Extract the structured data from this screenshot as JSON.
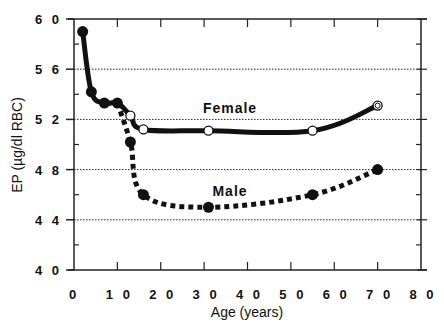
{
  "chart_data": {
    "type": "line",
    "title": "",
    "xlabel": "Age (years)",
    "ylabel": "EP (µg/dl RBC)",
    "xlim": [
      0,
      80
    ],
    "ylim": [
      40,
      60
    ],
    "x_ticks": [
      0,
      10,
      20,
      30,
      40,
      50,
      60,
      70,
      80
    ],
    "x_tick_labels": [
      "0",
      "1 0",
      "2 0",
      "3 0",
      "4 0",
      "5 0",
      "6 0",
      "7 0",
      "8 0"
    ],
    "y_ticks": [
      40,
      44,
      48,
      52,
      56,
      60
    ],
    "y_tick_labels": [
      "4 0",
      "4 4",
      "4 8",
      "5 2",
      "5 6",
      "6 0"
    ],
    "grid": "horizontal dotted at 44, 48, 52, 56",
    "series": [
      {
        "name": "Female",
        "style": "solid line, open circles",
        "x": [
          2,
          4,
          7,
          10,
          13,
          16,
          31,
          55,
          70
        ],
        "y": [
          59,
          54.2,
          53.3,
          53.3,
          52.3,
          51.2,
          51.1,
          51.1,
          53.1
        ]
      },
      {
        "name": "Male",
        "style": "dotted line, filled circles",
        "x": [
          2,
          4,
          7,
          10,
          13,
          16,
          31,
          55,
          70
        ],
        "y": [
          59,
          54.2,
          53.3,
          53.3,
          50.2,
          46,
          45,
          46,
          48
        ]
      }
    ],
    "annotations": [
      "Female",
      "Male"
    ]
  }
}
